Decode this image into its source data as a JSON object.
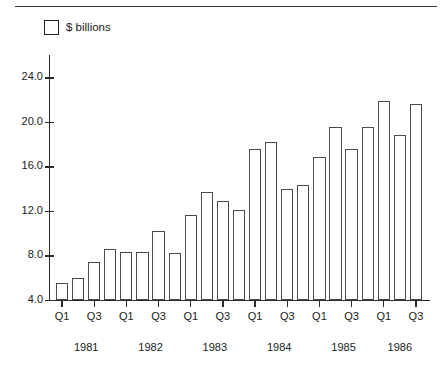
{
  "legend": {
    "swatch_name": "bar-swatch",
    "label": "$ billions"
  },
  "chart_data": {
    "type": "bar",
    "title": "",
    "subtitle": "",
    "xlabel": "",
    "ylabel": "",
    "ylim": [
      4.0,
      26.0
    ],
    "grid": false,
    "legend_position": "top-left",
    "legend_entries": [
      "$ billions"
    ],
    "y_ticks": [
      4.0,
      8.0,
      12.0,
      16.0,
      20.0,
      24.0
    ],
    "y_tick_labels": [
      "4.0",
      "8.0",
      "12.0",
      "16.0",
      "20.0",
      "24.0"
    ],
    "baseline": 4.0,
    "categories": [
      "Q1 1981",
      "Q2 1981",
      "Q3 1981",
      "Q4 1981",
      "Q1 1982",
      "Q2 1982",
      "Q3 1982",
      "Q4 1982",
      "Q1 1983",
      "Q2 1983",
      "Q3 1983",
      "Q4 1983",
      "Q1 1984",
      "Q2 1984",
      "Q3 1984",
      "Q4 1984",
      "Q1 1985",
      "Q2 1985",
      "Q3 1985",
      "Q4 1985",
      "Q1 1986",
      "Q2 1986",
      "Q3 1986"
    ],
    "values": [
      5.5,
      6.0,
      7.4,
      8.6,
      8.3,
      8.3,
      10.2,
      8.2,
      11.6,
      13.7,
      12.9,
      12.1,
      17.6,
      18.2,
      14.0,
      14.3,
      16.8,
      19.5,
      17.6,
      19.5,
      21.9,
      18.8,
      21.6
    ],
    "x_tick_labels": [
      "Q1",
      "Q3",
      "Q1",
      "Q3",
      "Q1",
      "Q3",
      "Q1",
      "Q3",
      "Q1",
      "Q3",
      "Q1",
      "Q3"
    ],
    "x_tick_category_index": [
      0,
      2,
      4,
      6,
      8,
      10,
      12,
      14,
      16,
      18,
      20,
      22
    ],
    "year_labels": [
      "1981",
      "1982",
      "1983",
      "1984",
      "1985",
      "1986"
    ],
    "year_center_index": [
      1.5,
      5.5,
      9.5,
      13.5,
      17.5,
      21.0
    ]
  }
}
